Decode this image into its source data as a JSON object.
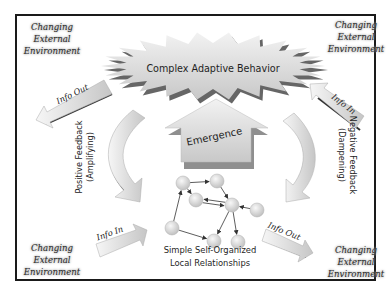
{
  "environment_label": {
    "top_left": [
      "Changing",
      "External",
      "Environment"
    ],
    "top_right": [
      "Changing",
      "External",
      "Environment"
    ],
    "bottom_left": [
      "Changing",
      "External",
      "Environment"
    ],
    "bottom_right": [
      "Changing",
      "External",
      "Environment"
    ]
  },
  "center": {
    "title": "Complex Adaptive Behavior",
    "emergence": "Emergence",
    "caption_line1": "Simple Self-Organized",
    "caption_line2": "Local Relationships"
  },
  "arrows": {
    "info_out_top": "Info Out",
    "info_in_top": "Info In",
    "info_in_bottom": "Info In",
    "info_out_bottom": "Info Out"
  },
  "feedback": {
    "positive_line1": "Positive Feedback",
    "positive_line2": "(Amplifying)",
    "negative_line1": "Negative Feedback",
    "negative_line2": "(Dampening)"
  },
  "network": {
    "nodes": [
      {
        "id": "a"
      },
      {
        "id": "b"
      },
      {
        "id": "c"
      },
      {
        "id": "d"
      },
      {
        "id": "e"
      },
      {
        "id": "f"
      },
      {
        "id": "g"
      },
      {
        "id": "h"
      }
    ],
    "edges": [
      [
        "a",
        "b"
      ],
      [
        "a",
        "c"
      ],
      [
        "b",
        "d"
      ],
      [
        "c",
        "d"
      ],
      [
        "d",
        "c"
      ],
      [
        "e",
        "d"
      ],
      [
        "f",
        "a"
      ],
      [
        "f",
        "g"
      ],
      [
        "d",
        "g"
      ],
      [
        "d",
        "h"
      ]
    ]
  },
  "colors": {
    "frame": "#1a1a1a",
    "shape_fill": "#d4d4d4",
    "shape_shadow": "#3a3a3a",
    "node_fill": "#dcdcdc"
  }
}
